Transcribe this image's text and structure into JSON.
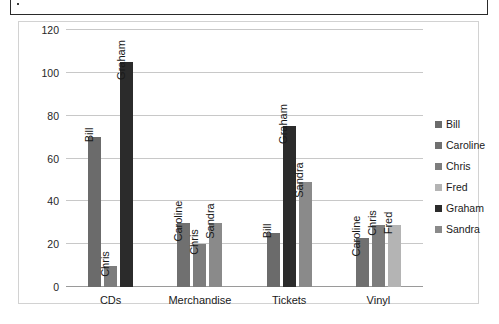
{
  "scan_artifact": {
    "present": true
  },
  "chart_data": {
    "type": "bar",
    "title": "",
    "subtitle": "",
    "xlabel": "",
    "ylabel": "",
    "categories": [
      "CDs",
      "Merchandise",
      "Tickets",
      "Vinyl"
    ],
    "yticks": [
      0,
      20,
      40,
      60,
      80,
      100,
      120
    ],
    "ylim": [
      0,
      120
    ],
    "grid": true,
    "legend_position": "right",
    "legend": [
      {
        "name": "Bill",
        "color": "#6b6b6b"
      },
      {
        "name": "Caroline",
        "color": "#707070"
      },
      {
        "name": "Chris",
        "color": "#7d7d7d"
      },
      {
        "name": "Fred",
        "color": "#b4b4b4"
      },
      {
        "name": "Graham",
        "color": "#2b2b2b"
      },
      {
        "name": "Sandra",
        "color": "#8a8a8a"
      }
    ],
    "series": [
      {
        "name": "Bill",
        "color": "#6b6b6b",
        "values": [
          70,
          null,
          25,
          null
        ]
      },
      {
        "name": "Caroline",
        "color": "#707070",
        "values": [
          null,
          30,
          null,
          23
        ]
      },
      {
        "name": "Chris",
        "color": "#7d7d7d",
        "values": [
          10,
          20,
          null,
          29
        ]
      },
      {
        "name": "Fred",
        "color": "#b4b4b4",
        "values": [
          null,
          null,
          null,
          29
        ]
      },
      {
        "name": "Graham",
        "color": "#2b2b2b",
        "values": [
          105,
          null,
          75,
          null
        ]
      },
      {
        "name": "Sandra",
        "color": "#8a8a8a",
        "values": [
          null,
          30,
          49,
          null
        ]
      }
    ],
    "bars": [
      {
        "category": "CDs",
        "series": "Bill",
        "value": 70,
        "label": "Bill",
        "color": "#6b6b6b"
      },
      {
        "category": "CDs",
        "series": "Chris",
        "value": 10,
        "label": "Chris",
        "color": "#7d7d7d"
      },
      {
        "category": "CDs",
        "series": "Graham",
        "value": 105,
        "label": "Graham",
        "color": "#2b2b2b"
      },
      {
        "category": "Merchandise",
        "series": "Caroline",
        "value": 30,
        "label": "Caroline",
        "color": "#707070"
      },
      {
        "category": "Merchandise",
        "series": "Chris",
        "value": 20,
        "label": "Chris",
        "color": "#7d7d7d"
      },
      {
        "category": "Merchandise",
        "series": "Sandra",
        "value": 30,
        "label": "Sandra",
        "color": "#8a8a8a"
      },
      {
        "category": "Tickets",
        "series": "Bill",
        "value": 25,
        "label": "Bill",
        "color": "#6b6b6b"
      },
      {
        "category": "Tickets",
        "series": "Graham",
        "value": 75,
        "label": "Graham",
        "color": "#2b2b2b"
      },
      {
        "category": "Tickets",
        "series": "Sandra",
        "value": 49,
        "label": "Sandra",
        "color": "#8a8a8a"
      },
      {
        "category": "Vinyl",
        "series": "Caroline",
        "value": 23,
        "label": "Caroline",
        "color": "#707070"
      },
      {
        "category": "Vinyl",
        "series": "Chris",
        "value": 29,
        "label": "Chris",
        "color": "#7d7d7d"
      },
      {
        "category": "Vinyl",
        "series": "Fred",
        "value": 29,
        "label": "Fred",
        "color": "#b4b4b4"
      }
    ]
  }
}
